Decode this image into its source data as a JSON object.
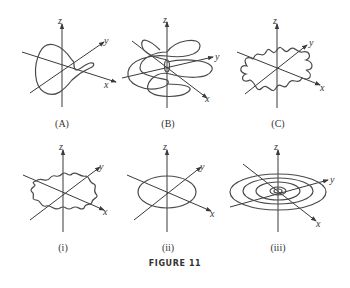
{
  "figure": {
    "caption": "FIGURE 11",
    "axis_labels": {
      "x": "x",
      "y": "y",
      "z": "z"
    },
    "panels": [
      {
        "id": "A",
        "label": "(A)",
        "description": "single closed loop curve around the origin with a small twist"
      },
      {
        "id": "B",
        "label": "(B)",
        "description": "multi-lobed helical/rosette curve spiraling around z-axis"
      },
      {
        "id": "C",
        "label": "(C)",
        "description": "wavy closed curve with small loops"
      },
      {
        "id": "i",
        "label": "(i)",
        "description": "star-shaped wavy closed curve in xy-plane"
      },
      {
        "id": "ii",
        "label": "(ii)",
        "description": "circle (ellipse in perspective) in xy-plane"
      },
      {
        "id": "iii",
        "label": "(iii)",
        "description": "spiral of concentric rings in xy-plane"
      }
    ]
  },
  "colors": {
    "ink": "#3a3a3a",
    "background": "#ffffff"
  }
}
